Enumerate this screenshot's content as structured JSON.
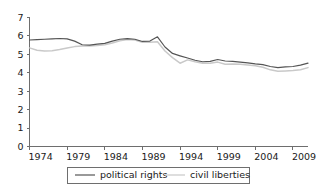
{
  "chart_data": {
    "type": "line",
    "title": "",
    "subtitle": "",
    "xlabel": "",
    "ylabel": "",
    "xlim": [
      1974,
      2011
    ],
    "ylim": [
      0,
      7
    ],
    "grid": false,
    "legend_position": "bottom",
    "x": [
      1974,
      1975,
      1976,
      1977,
      1978,
      1979,
      1980,
      1981,
      1982,
      1983,
      1984,
      1985,
      1986,
      1987,
      1988,
      1989,
      1990,
      1991,
      1992,
      1993,
      1994,
      1995,
      1996,
      1997,
      1998,
      1999,
      2000,
      2001,
      2002,
      2003,
      2004,
      2005,
      2006,
      2007,
      2008,
      2009,
      2010,
      2011
    ],
    "xticks": [
      1974,
      1979,
      1984,
      1989,
      1994,
      1999,
      2004,
      2009
    ],
    "xticklabels": [
      "1974",
      "1979",
      "1984",
      "1989",
      "1994",
      "1999",
      "2004",
      "2009"
    ],
    "yticks": [
      0,
      1,
      2,
      3,
      4,
      5,
      6,
      7
    ],
    "yticklabels": [
      "0",
      "1",
      "2",
      "3",
      "4",
      "5",
      "6",
      "7"
    ],
    "series": [
      {
        "name": "political rights",
        "color": "#555555",
        "values": [
          5.78,
          5.8,
          5.82,
          5.84,
          5.86,
          5.84,
          5.72,
          5.52,
          5.5,
          5.56,
          5.6,
          5.72,
          5.82,
          5.85,
          5.82,
          5.7,
          5.72,
          5.95,
          5.4,
          5.05,
          4.92,
          4.8,
          4.68,
          4.6,
          4.62,
          4.72,
          4.64,
          4.62,
          4.58,
          4.54,
          4.48,
          4.44,
          4.34,
          4.28,
          4.32,
          4.34,
          4.42,
          4.52
        ]
      },
      {
        "name": "civil liberties",
        "color": "#c9c9c9",
        "values": [
          5.35,
          5.22,
          5.18,
          5.2,
          5.26,
          5.34,
          5.42,
          5.46,
          5.46,
          5.48,
          5.52,
          5.62,
          5.74,
          5.8,
          5.78,
          5.66,
          5.66,
          5.68,
          5.18,
          4.82,
          4.52,
          4.7,
          4.6,
          4.52,
          4.52,
          4.58,
          4.46,
          4.48,
          4.46,
          4.42,
          4.38,
          4.3,
          4.16,
          4.08,
          4.1,
          4.12,
          4.16,
          4.28
        ]
      }
    ]
  },
  "legend": {
    "entries": [
      {
        "label": "political rights",
        "color": "#555555"
      },
      {
        "label": "civil liberties",
        "color": "#c9c9c9"
      }
    ]
  }
}
